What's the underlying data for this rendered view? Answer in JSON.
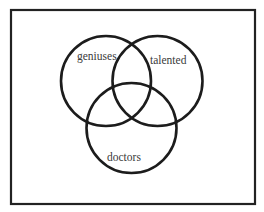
{
  "diagram": {
    "type": "venn",
    "title": "",
    "frame": {
      "x": 11,
      "y": 10,
      "width": 244,
      "height": 194,
      "stroke": "#222222"
    },
    "sets": [
      {
        "id": "geniuses",
        "label": "geniuses",
        "cx": 106,
        "cy": 81,
        "r": 45,
        "label_x": 77,
        "label_y": 60
      },
      {
        "id": "talented",
        "label": "talented",
        "cx": 157.5,
        "cy": 81,
        "r": 45,
        "label_x": 150,
        "label_y": 64
      },
      {
        "id": "doctors",
        "label": "doctors",
        "cx": 131.5,
        "cy": 128,
        "r": 45,
        "label_x": 107,
        "label_y": 161
      }
    ],
    "stroke_color": "#1c1c1c",
    "label_color": "#3a3a3a",
    "background": "#ffffff"
  }
}
